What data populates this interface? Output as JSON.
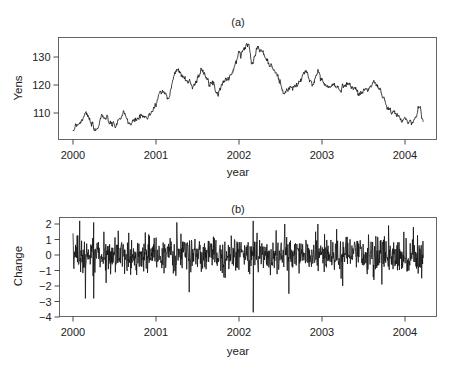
{
  "chart_data": [
    {
      "type": "line",
      "panel_label": "(a)",
      "title": "(a)",
      "xlabel": "year",
      "ylabel": "Yens",
      "xlim": [
        1999.85,
        2004.4
      ],
      "ylim": [
        101,
        136
      ],
      "xticks": [
        2000,
        2001,
        2002,
        2003,
        2004
      ],
      "xtick_labels": [
        "2000",
        "2001",
        "2002",
        "2003",
        "2004"
      ],
      "yticks": [
        110,
        120,
        130
      ],
      "ytick_labels": [
        "110",
        "120",
        "130"
      ],
      "grid": false,
      "legend": null,
      "series": [
        {
          "name": "Yen/USD exchange rate",
          "x": [
            2000.0,
            2000.03,
            2000.1,
            2000.15,
            2000.2,
            2000.27,
            2000.35,
            2000.42,
            2000.5,
            2000.6,
            2000.7,
            2000.8,
            2000.9,
            2000.95,
            2001.0,
            2001.05,
            2001.15,
            2001.25,
            2001.35,
            2001.45,
            2001.55,
            2001.65,
            2001.75,
            2001.8,
            2001.9,
            2002.0,
            2002.05,
            2002.12,
            2002.15,
            2002.22,
            2002.3,
            2002.35,
            2002.45,
            2002.55,
            2002.62,
            2002.7,
            2002.8,
            2002.88,
            2002.95,
            2003.05,
            2003.15,
            2003.2,
            2003.3,
            2003.45,
            2003.55,
            2003.65,
            2003.72,
            2003.78,
            2003.85,
            2003.95,
            2004.1,
            2004.18,
            2004.22
          ],
          "values": [
            102,
            106,
            107,
            111,
            107,
            103,
            109.5,
            107,
            105,
            109.5,
            106,
            108.5,
            108,
            111,
            113,
            118,
            116,
            126,
            122,
            120,
            125,
            122,
            117,
            121,
            123,
            131,
            133,
            134.5,
            128,
            133.5,
            131,
            128,
            124,
            117,
            119,
            119.5,
            125,
            120,
            125,
            119,
            120,
            118,
            121,
            117,
            119,
            120.5,
            117,
            112,
            110,
            108,
            106.5,
            113,
            107
          ]
        }
      ]
    },
    {
      "type": "line",
      "panel_label": "(b)",
      "title": "(b)",
      "xlabel": "year",
      "ylabel": "Change",
      "xlim": [
        1999.85,
        2004.4
      ],
      "ylim": [
        -4,
        2.5
      ],
      "xticks": [
        2000,
        2001,
        2002,
        2003,
        2004
      ],
      "xtick_labels": [
        "2000",
        "2001",
        "2002",
        "2003",
        "2004"
      ],
      "yticks": [
        2,
        1,
        0,
        -1,
        -2,
        -3,
        -4
      ],
      "ytick_labels": [
        "2",
        "1",
        "0",
        "−1",
        "−2",
        "−3",
        "−4"
      ],
      "grid": false,
      "legend": null,
      "series": [
        {
          "name": "Daily change",
          "notable_points": [
            {
              "x": 2000.0,
              "value": 1.4
            },
            {
              "x": 2000.08,
              "value": 2.2
            },
            {
              "x": 2000.15,
              "value": -2.8
            },
            {
              "x": 2000.25,
              "value": 2.1
            },
            {
              "x": 2000.25,
              "value": -2.8
            },
            {
              "x": 2000.4,
              "value": -1.8
            },
            {
              "x": 2001.25,
              "value": 2.1
            },
            {
              "x": 2001.4,
              "value": -2.4
            },
            {
              "x": 2002.17,
              "value": 2.2
            },
            {
              "x": 2002.17,
              "value": -3.7
            },
            {
              "x": 2002.55,
              "value": 2.0
            },
            {
              "x": 2002.6,
              "value": -2.5
            },
            {
              "x": 2002.95,
              "value": 2.0
            },
            {
              "x": 2003.25,
              "value": -2.0
            },
            {
              "x": 2003.72,
              "value": -1.9
            },
            {
              "x": 2003.8,
              "value": 1.9
            },
            {
              "x": 2004.1,
              "value": 1.8
            },
            {
              "x": 2004.2,
              "value": -1.5
            }
          ],
          "typical_range": [
            -1.2,
            1.2
          ]
        }
      ]
    }
  ]
}
